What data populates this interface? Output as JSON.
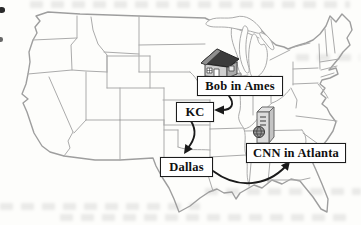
{
  "figure": {
    "labels": {
      "ames": "Bob in Ames",
      "kc": "KC",
      "dallas": "Dallas",
      "atlanta": "CNN in Atlanta"
    },
    "icons": [
      {
        "name": "house-icon",
        "location": "near Ames label"
      },
      {
        "name": "server-globe-icon",
        "location": "near CNN in Atlanta label"
      }
    ],
    "arrows": [
      {
        "from": "Bob in Ames",
        "to": "KC"
      },
      {
        "from": "KC",
        "to": "Dallas"
      },
      {
        "from": "Dallas",
        "to": "CNN in Atlanta"
      }
    ],
    "map": "Outline map of the continental United States with state borders",
    "colors": {
      "map_outline": "#9e9e9e",
      "state_line": "#ababab",
      "label_border": "#1c1c1c",
      "label_background": "#ffffff",
      "label_text": "#101010",
      "arrow": "#1a1a1a",
      "background": "#fdfdfb"
    }
  }
}
